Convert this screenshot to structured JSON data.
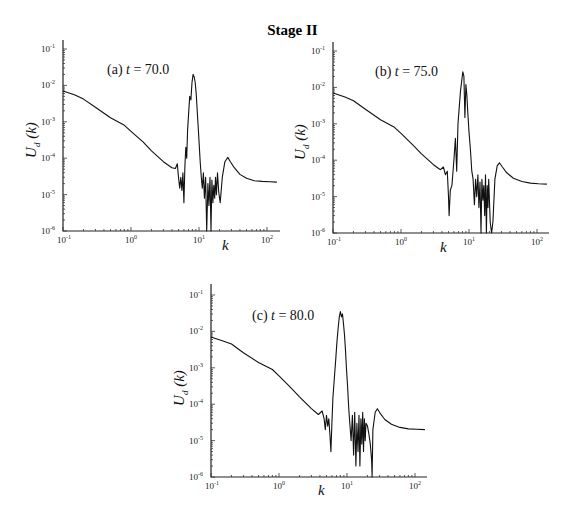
{
  "figure": {
    "title": "Stage II"
  },
  "chart_data": [
    {
      "type": "line",
      "id": "a",
      "title": "",
      "annotation": {
        "prefix": "(a) ",
        "var": "t",
        "value": " = 70.0"
      },
      "xlabel": "k",
      "ylabel": "U_d (k)",
      "xscale": "log",
      "yscale": "log",
      "xlim": [
        0.1,
        150
      ],
      "ylim": [
        1e-06,
        0.1
      ],
      "xticks": [
        "10^-1",
        "10^0",
        "10^1",
        "10^2"
      ],
      "yticks": [
        "10^-6",
        "10^-5",
        "10^-4",
        "10^-3",
        "10^-2",
        "10^-1"
      ],
      "grid": false,
      "layout": {
        "x0": 63,
        "y0": 231,
        "xdec": 68,
        "ydec": 36.4,
        "xend": 280,
        "ytop": 40,
        "annot_x": 107,
        "annot_y": 74,
        "ylabel_x": 36,
        "ylabel_y": 140,
        "xlabel_x": 222,
        "xlabel_y": 250
      },
      "series": [
        {
          "name": "U_d(k)",
          "k": [
            0.1,
            0.15,
            0.2,
            0.3,
            0.5,
            0.8,
            1.0,
            1.5,
            2.0,
            3.0,
            4.0,
            4.5,
            4.8,
            5.0,
            5.2,
            5.4,
            5.6,
            5.8,
            6.0,
            6.2,
            6.4,
            6.6,
            6.8,
            7.0,
            7.3,
            7.6,
            7.9,
            8.2,
            8.5,
            8.8,
            9.1,
            9.4,
            9.7,
            10.0,
            10.4,
            10.8,
            11.2,
            11.6,
            12.0,
            12.5,
            13.0,
            13.5,
            14.0,
            14.5,
            15.0,
            15.5,
            16.0,
            16.5,
            17.0,
            17.5,
            18.0,
            18.7,
            19.5,
            20.5,
            22.0,
            24.0,
            26.5,
            29.0,
            33.0,
            40.0,
            50.0,
            65.0,
            85.0,
            110.0,
            140.0
          ],
          "U": [
            0.007,
            0.0055,
            0.0042,
            0.0025,
            0.0013,
            0.0008,
            0.00055,
            0.00028,
            0.00016,
            8e-05,
            5.5e-05,
            5.2e-05,
            7e-05,
            3e-05,
            1.5e-05,
            3e-05,
            1.3e-05,
            4e-05,
            6e-06,
            6e-05,
            0.0002,
            0.0001,
            0.0006,
            0.0015,
            0.005,
            0.004,
            0.012,
            0.02,
            0.017,
            0.012,
            0.006,
            0.002,
            0.0008,
            0.0003,
            8e-05,
            3e-05,
            1.5e-05,
            4e-05,
            8e-06,
            3e-05,
            1e-06,
            2e-05,
            5e-06,
            3e-05,
            1e-06,
            2.5e-05,
            6e-06,
            1.8e-05,
            8e-06,
            3e-05,
            1e-05,
            4e-05,
            1.2e-05,
            6e-06,
            3e-05,
            8e-05,
            0.000105,
            8e-05,
            5.5e-05,
            3.6e-05,
            2.8e-05,
            2.4e-05,
            2.3e-05,
            2.25e-05,
            2.2e-05
          ]
        }
      ]
    },
    {
      "type": "line",
      "id": "b",
      "title": "",
      "annotation": {
        "prefix": "(b) ",
        "var": "t",
        "value": " = 75.0"
      },
      "xlabel": "k",
      "ylabel": "U_d (k)",
      "xscale": "log",
      "yscale": "log",
      "xlim": [
        0.1,
        150
      ],
      "ylim": [
        1e-06,
        0.1
      ],
      "xticks": [
        "10^-1",
        "10^0",
        "10^1",
        "10^2"
      ],
      "yticks": [
        "10^-6",
        "10^-5",
        "10^-4",
        "10^-3",
        "10^-2",
        "10^-1"
      ],
      "grid": false,
      "layout": {
        "x0": 333,
        "y0": 233,
        "xdec": 68,
        "ydec": 36.4,
        "xend": 549,
        "ytop": 42,
        "annot_x": 375,
        "annot_y": 76,
        "ylabel_x": 305,
        "ylabel_y": 142,
        "xlabel_x": 440,
        "xlabel_y": 252
      },
      "series": [
        {
          "name": "U_d(k)",
          "k": [
            0.1,
            0.15,
            0.2,
            0.3,
            0.5,
            0.8,
            1.0,
            1.5,
            2.0,
            3.0,
            3.8,
            4.2,
            4.5,
            4.8,
            5.0,
            5.1,
            5.3,
            5.6,
            6.0,
            6.3,
            6.6,
            6.9,
            7.2,
            7.5,
            7.8,
            8.1,
            8.4,
            8.7,
            9.0,
            9.3,
            9.6,
            10.0,
            10.5,
            11.0,
            11.5,
            12.0,
            12.5,
            13.0,
            13.5,
            14.0,
            14.5,
            15.0,
            15.5,
            16.0,
            16.5,
            17.0,
            17.5,
            18.0,
            18.5,
            19.0,
            19.5,
            20.5,
            21.5,
            22.5,
            24.0,
            26.0,
            28.0,
            31.0,
            36.0,
            45.0,
            60.0,
            80.0,
            105.0,
            140.0
          ],
          "U": [
            0.007,
            0.0055,
            0.0043,
            0.0025,
            0.0013,
            0.0008,
            0.00055,
            0.00026,
            0.00015,
            7.5e-05,
            5.5e-05,
            6.5e-05,
            4e-05,
            5e-05,
            1e-05,
            3e-06,
            1.5e-05,
            2e-05,
            0.0001,
            0.0004,
            5e-05,
            0.001,
            0.003,
            0.008,
            0.015,
            0.027,
            0.02,
            0.0015,
            0.012,
            0.006,
            0.002,
            0.0006,
            0.0002,
            5e-05,
            3e-05,
            6e-06,
            3e-05,
            1e-05,
            4e-05,
            5e-06,
            2.5e-05,
            1e-06,
            3e-05,
            8e-06,
            2e-05,
            3e-06,
            4e-05,
            1e-06,
            2e-05,
            5e-06,
            3e-05,
            2e-06,
            1e-06,
            2e-06,
            3e-05,
            7e-05,
            8.5e-05,
            6.5e-05,
            4.5e-05,
            3.2e-05,
            2.6e-05,
            2.35e-05,
            2.25e-05,
            2.2e-05
          ]
        }
      ]
    },
    {
      "type": "line",
      "id": "c",
      "title": "",
      "annotation": {
        "prefix": "(c) ",
        "var": "t",
        "value": " = 80.0"
      },
      "xlabel": "k",
      "ylabel": "U_d (k)",
      "xscale": "log",
      "yscale": "log",
      "xlim": [
        0.1,
        150
      ],
      "ylim": [
        1e-06,
        0.1
      ],
      "xticks": [
        "10^-1",
        "10^0",
        "10^1",
        "10^2"
      ],
      "yticks": [
        "10^-6",
        "10^-5",
        "10^-4",
        "10^-3",
        "10^-2",
        "10^-1"
      ],
      "grid": false,
      "layout": {
        "x0": 211,
        "y0": 477,
        "xdec": 68,
        "ydec": 36.4,
        "xend": 427,
        "ytop": 284,
        "annot_x": 252,
        "annot_y": 320,
        "ylabel_x": 184,
        "ylabel_y": 388,
        "xlabel_x": 318,
        "xlabel_y": 495
      },
      "series": [
        {
          "name": "U_d(k)",
          "k": [
            0.1,
            0.15,
            0.2,
            0.3,
            0.5,
            0.8,
            1.0,
            1.5,
            2.0,
            3.0,
            3.8,
            4.3,
            4.6,
            4.8,
            5.0,
            5.2,
            5.4,
            5.6,
            5.8,
            6.0,
            6.2,
            6.5,
            6.8,
            7.1,
            7.4,
            7.7,
            8.0,
            8.3,
            8.6,
            8.9,
            9.2,
            9.5,
            9.8,
            10.2,
            10.6,
            11.0,
            11.5,
            12.0,
            12.5,
            13.0,
            13.5,
            14.0,
            14.5,
            15.0,
            15.5,
            16.0,
            16.5,
            17.0,
            17.5,
            18.0,
            18.5,
            19.0,
            20.0,
            21.0,
            22.0,
            23.0,
            23.4,
            24.0,
            26.0,
            28.0,
            31.0,
            36.0,
            45.0,
            60.0,
            80.0,
            105.0,
            140.0
          ],
          "U": [
            0.007,
            0.0055,
            0.0045,
            0.0026,
            0.0014,
            0.0009,
            0.0006,
            0.00028,
            0.00016,
            7.5e-05,
            5.2e-05,
            6.5e-05,
            4e-05,
            2e-05,
            5e-05,
            2.5e-05,
            4e-05,
            1.5e-05,
            5e-06,
            3e-05,
            0.00015,
            0.0005,
            0.0015,
            0.005,
            0.012,
            0.025,
            0.035,
            0.025,
            0.03,
            0.015,
            0.008,
            0.003,
            0.001,
            0.0003,
            8e-05,
            3e-05,
            1e-05,
            5e-05,
            4e-06,
            6e-05,
            2e-06,
            3e-05,
            5e-06,
            5e-05,
            2e-06,
            4e-05,
            8e-06,
            6e-05,
            5e-06,
            4e-05,
            1e-05,
            3e-05,
            2.5e-05,
            1.5e-05,
            8e-06,
            3e-06,
            1e-06,
            2e-05,
            6e-05,
            7.5e-05,
            5.5e-05,
            3.8e-05,
            2.8e-05,
            2.3e-05,
            2.1e-05,
            2.05e-05,
            2e-05
          ]
        }
      ]
    }
  ]
}
